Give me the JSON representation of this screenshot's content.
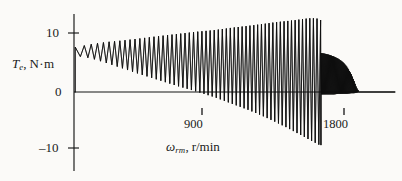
{
  "figure": {
    "name": "electromagnetic-torque-vs-rotor-speed",
    "background_color": "#fbfaf8",
    "ink_color": "#101010"
  },
  "axes": {
    "y": {
      "title_symbol": "T",
      "title_subscript": "e",
      "title_separator": ",",
      "title_units": "N·m",
      "full_label": "T_e, N·m",
      "ticks": [
        {
          "label": "10",
          "value": 10
        },
        {
          "label": "0",
          "value": 0
        },
        {
          "label": "–10",
          "value": -10
        }
      ],
      "range": [
        -14,
        13.5
      ]
    },
    "x": {
      "title_symbol": "ω",
      "title_subscript": "rm",
      "title_separator": ",",
      "title_units": "r/min",
      "full_label": "ω_rm, r/min",
      "ticks": [
        {
          "label": "900",
          "value": 900
        },
        {
          "label": "1800",
          "value": 1800
        }
      ],
      "range": [
        0,
        2050
      ]
    }
  },
  "chart_data": {
    "type": "line",
    "title": "",
    "subtitle": "",
    "xlabel": "ω_rm, r/min",
    "ylabel": "T_e, N·m",
    "xlim": [
      0,
      2050
    ],
    "ylim": [
      -14,
      13.5
    ],
    "grid": false,
    "legend": null,
    "series": [
      {
        "name": "envelope-upper",
        "comment": "upper bound of the torque oscillation, N·m vs r/min",
        "x": [
          8,
          20,
          40,
          70,
          110,
          160,
          220,
          300,
          400,
          520,
          650,
          780,
          900,
          1010,
          1110,
          1200,
          1280,
          1350,
          1420,
          1470,
          1510,
          1540,
          1560,
          1575
        ],
        "y": [
          7.6,
          7.9,
          7.7,
          7.9,
          8.1,
          8.3,
          8.5,
          8.7,
          9.0,
          9.4,
          9.8,
          10.2,
          10.5,
          10.9,
          11.2,
          11.5,
          11.8,
          12.0,
          12.2,
          12.4,
          12.5,
          12.5,
          12.4,
          12.2
        ]
      },
      {
        "name": "envelope-lower",
        "comment": "lower bound of the torque oscillation, N·m vs r/min",
        "x": [
          8,
          20,
          40,
          70,
          110,
          160,
          220,
          300,
          400,
          520,
          650,
          780,
          900,
          1010,
          1110,
          1200,
          1280,
          1350,
          1420,
          1470,
          1510,
          1540,
          1560,
          1575
        ],
        "y": [
          0.0,
          6.2,
          6.0,
          5.9,
          5.7,
          5.3,
          4.8,
          4.1,
          3.2,
          2.2,
          1.1,
          0.1,
          -0.9,
          -2.0,
          -3.0,
          -4.0,
          -5.0,
          -5.9,
          -6.9,
          -7.6,
          -8.2,
          -8.6,
          -8.9,
          -9.0
        ]
      },
      {
        "name": "post-pullout-envelope-upper",
        "comment": "decaying torque band after pull-out, N·m vs r/min",
        "x": [
          1578,
          1600,
          1630,
          1660,
          1690,
          1720,
          1745,
          1770,
          1790,
          1805,
          1820
        ],
        "y": [
          6.6,
          6.5,
          6.3,
          6.0,
          5.6,
          5.0,
          4.2,
          3.1,
          1.8,
          0.7,
          0.1
        ]
      },
      {
        "name": "post-pullout-envelope-lower",
        "comment": "lower bound of decaying band, N·m vs r/min",
        "x": [
          1578,
          1600,
          1630,
          1660,
          1690,
          1720,
          1745,
          1770,
          1790,
          1805,
          1820
        ],
        "y": [
          -0.4,
          -0.4,
          -0.4,
          -0.4,
          -0.3,
          -0.3,
          -0.3,
          -0.2,
          -0.2,
          -0.1,
          0.0
        ]
      },
      {
        "name": "steady-state",
        "comment": "flat zero torque after synchronous speed reached",
        "x": [
          1820,
          2050
        ],
        "y": [
          0.0,
          0.0
        ]
      }
    ],
    "annotations": [
      {
        "text": "pull-out / collapse",
        "x": 1575,
        "y": 12.4,
        "rendered": false
      }
    ]
  },
  "render": {
    "pullout_x_px": 287,
    "zero_y_px": 92,
    "y_axis_x_px": 74,
    "zero_line_end_px": 395,
    "oscillation_count_main": 56,
    "oscillation_count_tail": 40
  }
}
